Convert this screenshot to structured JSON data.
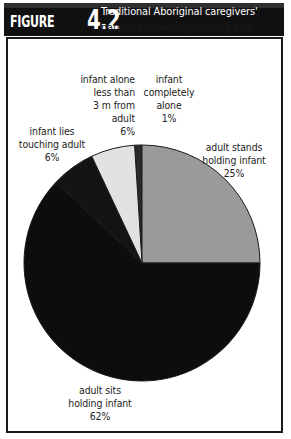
{
  "figure": {
    "badge_word": "FIGURE",
    "badge_number": "4.2",
    "title_line_1": "Traditional Aboriginal caregivers'",
    "title_line_2": "patterns of tending waking and",
    "title_line_3": "sleeping infants aged 0 to 6 months"
  },
  "colors": {
    "banner_background": "#111111",
    "banner_text": "#ffffff",
    "frame_border": "#1a1a1a",
    "page_background": "#ffffff",
    "label_text": "#222222",
    "slice_adult_sits": "#0d0d0d",
    "slice_adult_stands": "#9a9a9a",
    "slice_infant_alone_3m": "#e2e2e2",
    "slice_infant_lies_touching": "#141414",
    "slice_infant_completely_alone": "#2a2a2a",
    "slice_outline": "#1a1a1a"
  },
  "labels": {
    "infant_alone_3m": {
      "line_1": "infant alone",
      "line_2": "less than",
      "line_3": "3 m from",
      "line_4": "adult",
      "value": "6%"
    },
    "infant_completely_alone": {
      "line_1": "infant",
      "line_2": "completely",
      "line_3": "alone",
      "value": "1%"
    },
    "infant_lies_touching_adult": {
      "line_1": "infant lies",
      "line_2": "touching adult",
      "value": "6%"
    },
    "adult_stands_holding_infant": {
      "line_1": "adult stands",
      "line_2": "holding infant",
      "value": "25%"
    },
    "adult_sits_holding_infant": {
      "line_1": "adult sits",
      "line_2": "holding infant",
      "value": "62%"
    }
  },
  "chart_data": {
    "type": "pie",
    "title": "Traditional Aboriginal caregivers' patterns of tending waking and sleeping infants aged 0 to 6 months",
    "xlabel": "",
    "ylabel": "",
    "legend_position": "callout-labels",
    "grid": false,
    "start_angle_deg": 0,
    "direction": "clockwise",
    "categories": [
      "infant completely alone",
      "adult stands holding infant",
      "adult sits holding infant",
      "infant lies touching adult",
      "infant alone less than 3 m from adult"
    ],
    "values": [
      1,
      25,
      62,
      6,
      6
    ],
    "value_labels": [
      "1%",
      "25%",
      "62%",
      "6%",
      "6%"
    ],
    "slice_colors": [
      "#2a2a2a",
      "#9a9a9a",
      "#0d0d0d",
      "#141414",
      "#e2e2e2"
    ],
    "total": 100,
    "units": "percent"
  }
}
